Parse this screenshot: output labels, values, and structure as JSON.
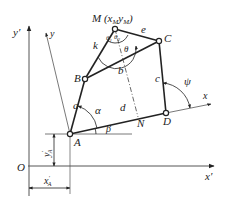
{
  "diagram": {
    "type": "four-bar linkage kinematic diagram",
    "axes": {
      "origin": "O",
      "fixed_x": "x′",
      "fixed_y": "y′",
      "moving_x": "x",
      "moving_y": "y"
    },
    "joints": {
      "A": "A",
      "B": "B",
      "C": "C",
      "D": "D",
      "M": "M",
      "N": "N"
    },
    "point_M_label": "M (x",
    "point_M_sub1": "M",
    "point_M_mid": "y",
    "point_M_sub2": "M",
    "point_M_close": ")",
    "links": {
      "a": "a",
      "b": "b",
      "c": "c",
      "d": "d",
      "e": "e",
      "k": "k"
    },
    "angles": {
      "alpha": "α",
      "beta": "β",
      "psi": "ψ",
      "theta": "θ",
      "theta1": "θ",
      "theta1_sub": "1",
      "theta2": "θ",
      "theta2_sub": "2"
    },
    "dimensions": {
      "xA": "x",
      "xA_sub": "A",
      "xA_prime": "′",
      "yA": "y",
      "yA_sub": "A",
      "yA_prime": "′"
    },
    "colors": {
      "stroke": "#222222",
      "axis": "#555555",
      "dashed": "#444444"
    }
  }
}
